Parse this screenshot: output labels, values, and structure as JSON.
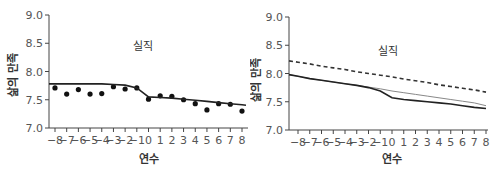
{
  "chart_data": [
    {
      "type": "line",
      "title": "",
      "annotation": "실직",
      "xlabel": "연수",
      "ylabel": "삶의 만족",
      "x": [
        -8,
        -7,
        -6,
        -5,
        -4,
        -3,
        -2,
        -1,
        0,
        1,
        2,
        3,
        4,
        5,
        6,
        7,
        8
      ],
      "x_tick_labels": [
        "−8",
        "−7",
        "−6",
        "−5",
        "−4",
        "−3",
        "−2",
        "−1",
        "0",
        "1",
        "2",
        "3",
        "4",
        "5",
        "6",
        "7",
        "8"
      ],
      "y_tick_labels": [
        "7.0",
        "7.5",
        "8.0",
        "8.5",
        "9.0"
      ],
      "y_ticks": [
        7.0,
        7.5,
        8.0,
        8.5,
        9.0
      ],
      "ylim": [
        7.0,
        9.0
      ],
      "xlim": [
        -8.5,
        8.5
      ],
      "grid": false,
      "legend": null,
      "series": [
        {
          "name": "observed",
          "style": "scatter",
          "color": "#111111",
          "values": [
            7.71,
            7.6,
            7.68,
            7.6,
            7.61,
            7.73,
            7.69,
            7.71,
            7.51,
            7.57,
            7.56,
            7.5,
            7.43,
            7.32,
            7.43,
            7.42,
            7.3
          ]
        },
        {
          "name": "fitted",
          "style": "solid",
          "color": "#222222",
          "values": [
            7.78,
            7.78,
            7.78,
            7.78,
            7.78,
            7.77,
            7.76,
            7.71,
            7.55,
            7.54,
            7.53,
            7.51,
            7.49,
            7.47,
            7.45,
            7.43,
            7.41
          ]
        }
      ]
    },
    {
      "type": "line",
      "title": "",
      "annotation": "실직",
      "xlabel": "연수",
      "ylabel": "삶의 만족",
      "x": [
        -8,
        -7,
        -6,
        -5,
        -4,
        -3,
        -2,
        -1,
        0,
        1,
        2,
        3,
        4,
        5,
        6,
        7,
        8
      ],
      "x_tick_labels": [
        "−8",
        "−7",
        "−6",
        "−5",
        "−4",
        "−3",
        "−2",
        "−1",
        "0",
        "1",
        "2",
        "3",
        "4",
        "5",
        "6",
        "7",
        "8"
      ],
      "y_tick_labels": [
        "7.0",
        "7.5",
        "8.0",
        "8.5",
        "9.0"
      ],
      "y_ticks": [
        7.0,
        7.5,
        8.0,
        8.5,
        9.0
      ],
      "ylim": [
        7.0,
        9.0
      ],
      "xlim": [
        -8.5,
        8.5
      ],
      "grid": false,
      "legend": null,
      "series": [
        {
          "name": "dashed-reference",
          "style": "dashed",
          "color": "#333333",
          "values": [
            8.2,
            8.17,
            8.13,
            8.1,
            8.07,
            8.03,
            8.0,
            7.97,
            7.94,
            7.9,
            7.87,
            7.84,
            7.8,
            7.77,
            7.74,
            7.71,
            7.67
          ]
        },
        {
          "name": "without-unemployment",
          "style": "solid-thin",
          "color": "#888888",
          "values": [
            7.95,
            7.91,
            7.88,
            7.85,
            7.82,
            7.79,
            7.76,
            7.73,
            7.69,
            7.66,
            7.63,
            7.6,
            7.57,
            7.54,
            7.51,
            7.48,
            7.43
          ]
        },
        {
          "name": "with-unemployment",
          "style": "solid",
          "color": "#222222",
          "values": [
            7.95,
            7.91,
            7.88,
            7.85,
            7.82,
            7.79,
            7.75,
            7.69,
            7.57,
            7.54,
            7.52,
            7.5,
            7.48,
            7.46,
            7.43,
            7.4,
            7.38
          ]
        }
      ]
    }
  ]
}
